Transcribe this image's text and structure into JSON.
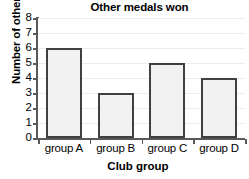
{
  "chart_data": {
    "type": "bar",
    "title": "Other medals won",
    "xlabel": "Club group",
    "ylabel": "Number of other medals",
    "categories": [
      "group A",
      "group B",
      "group C",
      "group D"
    ],
    "values": [
      6,
      3,
      5,
      4
    ],
    "ylim": [
      0,
      8
    ],
    "yticks": [
      0,
      1,
      2,
      3,
      4,
      5,
      6,
      7,
      8
    ],
    "ytick_labels": [
      "0",
      "1",
      "2",
      "3",
      "4",
      "5",
      "6",
      "7",
      "8"
    ],
    "grid": true,
    "legend": null,
    "colors": {
      "bar_fill": "#f2f2f2",
      "bar_edge": "#404042",
      "axis": "#58595b",
      "gridline": "#ececed",
      "text": "#000000",
      "background": "#ffffff"
    }
  }
}
